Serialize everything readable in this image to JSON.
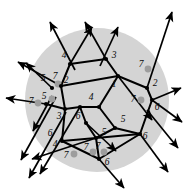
{
  "figure": {
    "name": "labeled-planar-graph-in-disk",
    "background_color": "#ffffff",
    "disk": {
      "fill_color": "#d4d4d4",
      "cx": 97,
      "cy": 100,
      "r": 72
    },
    "colors": {
      "edge": "#000000",
      "vertex": "#000000",
      "marked_dot": "#9d9d9d",
      "label": "#0a0a0a"
    }
  },
  "labels": [
    {
      "id": "l01",
      "text": "4",
      "x": 64,
      "y": 56
    },
    {
      "id": "l02",
      "text": "3",
      "x": 114,
      "y": 56
    },
    {
      "id": "l03",
      "text": "7",
      "x": 141,
      "y": 65
    },
    {
      "id": "l04",
      "text": "5",
      "x": 43,
      "y": 79
    },
    {
      "id": "l05",
      "text": "7",
      "x": 55,
      "y": 77
    },
    {
      "id": "l06",
      "text": "2",
      "x": 66,
      "y": 81
    },
    {
      "id": "l07",
      "text": "1",
      "x": 114,
      "y": 85
    },
    {
      "id": "l08",
      "text": "2",
      "x": 155,
      "y": 84
    },
    {
      "id": "l09",
      "text": "7",
      "x": 31,
      "y": 102
    },
    {
      "id": "l10",
      "text": "5",
      "x": 44,
      "y": 97
    },
    {
      "id": "l11",
      "text": "4",
      "x": 91,
      "y": 98
    },
    {
      "id": "l12",
      "text": "7",
      "x": 133,
      "y": 100
    },
    {
      "id": "l13",
      "text": "6",
      "x": 157,
      "y": 108
    },
    {
      "id": "l14",
      "text": "3",
      "x": 59,
      "y": 117
    },
    {
      "id": "l15",
      "text": "6",
      "x": 78,
      "y": 117
    },
    {
      "id": "l16",
      "text": "5",
      "x": 123,
      "y": 120
    },
    {
      "id": "l17",
      "text": "6",
      "x": 50,
      "y": 134
    },
    {
      "id": "l18",
      "text": "5",
      "x": 104,
      "y": 133
    },
    {
      "id": "l19",
      "text": "4",
      "x": 55,
      "y": 145
    },
    {
      "id": "l20",
      "text": "7",
      "x": 86,
      "y": 148
    },
    {
      "id": "l21",
      "text": "7",
      "x": 98,
      "y": 147
    },
    {
      "id": "l22",
      "text": "6",
      "x": 145,
      "y": 137
    },
    {
      "id": "l23",
      "text": "7",
      "x": 66,
      "y": 156
    },
    {
      "id": "l24",
      "text": "6",
      "x": 107,
      "y": 163
    }
  ],
  "vertices": [
    {
      "id": "v01",
      "x": 70,
      "y": 64
    },
    {
      "id": "v02",
      "x": 106,
      "y": 59
    },
    {
      "id": "v03",
      "x": 61,
      "y": 86
    },
    {
      "id": "v04",
      "x": 118,
      "y": 76
    },
    {
      "id": "v05",
      "x": 147,
      "y": 88
    },
    {
      "id": "v06",
      "x": 46,
      "y": 104
    },
    {
      "id": "v07",
      "x": 80,
      "y": 107
    },
    {
      "id": "v08",
      "x": 99,
      "y": 107
    },
    {
      "id": "v09",
      "x": 65,
      "y": 109
    },
    {
      "id": "v10",
      "x": 152,
      "y": 100
    },
    {
      "id": "v11",
      "x": 86,
      "y": 123
    },
    {
      "id": "v12",
      "x": 115,
      "y": 128
    },
    {
      "id": "v13",
      "x": 62,
      "y": 141
    },
    {
      "id": "v14",
      "x": 96,
      "y": 138
    },
    {
      "id": "v15",
      "x": 140,
      "y": 134
    },
    {
      "id": "v16",
      "x": 99,
      "y": 159
    },
    {
      "id": "v17",
      "x": 52,
      "y": 88
    }
  ],
  "marked_dots": [
    {
      "id": "d1",
      "x": 148,
      "y": 69
    },
    {
      "id": "d2",
      "x": 141,
      "y": 100
    },
    {
      "id": "d3",
      "x": 58,
      "y": 84
    },
    {
      "id": "d4",
      "x": 52,
      "y": 99
    },
    {
      "id": "d5",
      "x": 38,
      "y": 103
    },
    {
      "id": "d6",
      "x": 74,
      "y": 154
    },
    {
      "id": "d7",
      "x": 93,
      "y": 152
    },
    {
      "id": "d8",
      "x": 104,
      "y": 152
    }
  ],
  "edges": [
    {
      "from": "v01",
      "to": "v02"
    },
    {
      "from": "v01",
      "to": "v03"
    },
    {
      "from": "v02",
      "to": "v04"
    },
    {
      "from": "v03",
      "to": "v04"
    },
    {
      "from": "v04",
      "to": "v05"
    },
    {
      "from": "v03",
      "to": "v09"
    },
    {
      "from": "v09",
      "to": "v07"
    },
    {
      "from": "v07",
      "to": "v08"
    },
    {
      "from": "v08",
      "to": "v04"
    },
    {
      "from": "v06",
      "to": "v09"
    },
    {
      "from": "v05",
      "to": "v10"
    },
    {
      "from": "v10",
      "to": "v15"
    },
    {
      "from": "v08",
      "to": "v12"
    },
    {
      "from": "v12",
      "to": "v15"
    },
    {
      "from": "v11",
      "to": "v14"
    },
    {
      "from": "v14",
      "to": "v12"
    },
    {
      "from": "v14",
      "to": "v15"
    },
    {
      "from": "v09",
      "to": "v13"
    },
    {
      "from": "v13",
      "to": "v14"
    },
    {
      "from": "v13",
      "to": "v16"
    },
    {
      "from": "v16",
      "to": "v14"
    },
    {
      "from": "v07",
      "to": "v11"
    },
    {
      "from": "v15",
      "to": "v16"
    }
  ],
  "arrows": [
    {
      "id": "a01",
      "x1": 75,
      "y1": 70,
      "x2": 50,
      "y2": 22
    },
    {
      "id": "a02",
      "x1": 70,
      "y1": 64,
      "x2": 92,
      "y2": 27
    },
    {
      "id": "a03",
      "x1": 106,
      "y1": 59,
      "x2": 85,
      "y2": 22
    },
    {
      "id": "a04",
      "x1": 100,
      "y1": 66,
      "x2": 118,
      "y2": 27
    },
    {
      "id": "a05",
      "x1": 147,
      "y1": 88,
      "x2": 172,
      "y2": 12
    },
    {
      "id": "a06",
      "x1": 118,
      "y1": 76,
      "x2": 152,
      "y2": 120
    },
    {
      "id": "a07",
      "x1": 61,
      "y1": 86,
      "x2": 18,
      "y2": 62
    },
    {
      "id": "a08",
      "x1": 52,
      "y1": 88,
      "x2": 26,
      "y2": 63
    },
    {
      "id": "a09",
      "x1": 46,
      "y1": 104,
      "x2": 6,
      "y2": 98
    },
    {
      "id": "a10",
      "x1": 52,
      "y1": 96,
      "x2": 33,
      "y2": 131
    },
    {
      "id": "a11",
      "x1": 56,
      "y1": 97,
      "x2": 21,
      "y2": 160
    },
    {
      "id": "a12",
      "x1": 66,
      "y1": 112,
      "x2": 29,
      "y2": 178
    },
    {
      "id": "a13",
      "x1": 80,
      "y1": 107,
      "x2": 40,
      "y2": 174
    },
    {
      "id": "a14",
      "x1": 96,
      "y1": 138,
      "x2": 32,
      "y2": 159
    },
    {
      "id": "a15",
      "x1": 99,
      "y1": 159,
      "x2": 124,
      "y2": 188
    },
    {
      "id": "a16",
      "x1": 140,
      "y1": 134,
      "x2": 168,
      "y2": 172
    },
    {
      "id": "a17",
      "x1": 152,
      "y1": 100,
      "x2": 182,
      "y2": 122
    },
    {
      "id": "a18",
      "x1": 147,
      "y1": 110,
      "x2": 178,
      "y2": 148
    },
    {
      "id": "a19",
      "x1": 152,
      "y1": 100,
      "x2": 181,
      "y2": 88
    },
    {
      "id": "a20",
      "x1": 86,
      "y1": 123,
      "x2": 116,
      "y2": 151
    }
  ]
}
